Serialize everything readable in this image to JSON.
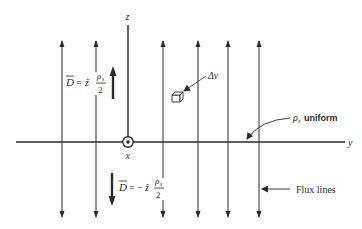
{
  "diagram": {
    "axes": {
      "z_label": "z",
      "y_label": "y",
      "x_label": "x"
    },
    "field_above": {
      "D": "D",
      "eq": "=",
      "unit": "ẑ",
      "num": "ρ",
      "num_sub": "s",
      "den": "2"
    },
    "field_below": {
      "D": "D",
      "eq": "= −",
      "unit": "ẑ",
      "num": "ρ",
      "num_sub": "s",
      "den": "2"
    },
    "volume_label": "Δv",
    "sheet_label": {
      "rho": "ρ",
      "sub": "s",
      "text": "uniform"
    },
    "flux_label": "Flux lines",
    "flux_line_x": [
      62,
      96,
      163,
      198,
      228,
      259
    ],
    "colors": {
      "ink": "#2a2a2a",
      "background": "#ffffff"
    }
  }
}
